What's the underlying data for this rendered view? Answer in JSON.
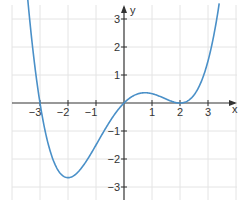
{
  "chart_data": {
    "type": "line",
    "title": "",
    "xlabel": "x",
    "ylabel": "y",
    "xlim": [
      -4,
      4
    ],
    "ylim": [
      -3.5,
      3.5
    ],
    "grid": true,
    "x_ticks": [
      -3,
      -2,
      -1,
      1,
      2,
      3
    ],
    "y_ticks": [
      -3,
      -2,
      -1,
      1,
      2,
      3
    ],
    "x_tick_labels": [
      "−3",
      "−2",
      "−1",
      "1",
      "2",
      "3"
    ],
    "y_tick_labels": [
      "−3",
      "−2",
      "−1",
      "1",
      "2",
      "3"
    ],
    "series": [
      {
        "name": "f(x)",
        "formula": "(1/12)·x·(x+3)·(x−2)²",
        "color": "#4a90c8",
        "x": [
          -3.45,
          -3,
          -2.5,
          -2,
          -1.5,
          -1,
          -0.5,
          0,
          0.5,
          0.75,
          1,
          1.5,
          2,
          2.5,
          3,
          3.4
        ],
        "y": [
          3.4,
          0,
          -2.36,
          -2.67,
          -1.53,
          -0.75,
          -0.39,
          0,
          0.33,
          0.36,
          0.33,
          0.14,
          0,
          0.09,
          1.5,
          3.55
        ]
      }
    ],
    "roots": [
      -3,
      0,
      2
    ],
    "local_min": {
      "x": -2,
      "y": -2.67
    },
    "local_max": {
      "x": 0.75,
      "y": 0.36
    }
  },
  "axes": {
    "x_label": "x",
    "y_label": "y",
    "axis_color": "#333333",
    "grid_color": "#e4e4e4"
  }
}
